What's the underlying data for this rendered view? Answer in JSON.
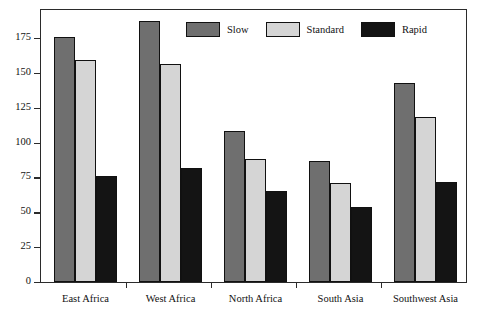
{
  "chart_data": {
    "type": "bar",
    "title": "",
    "xlabel": "",
    "ylabel": "Percent",
    "ylim": [
      0,
      195
    ],
    "yticks": [
      0,
      25,
      50,
      75,
      100,
      125,
      150,
      175
    ],
    "ytick_labels": [
      "0",
      "25",
      "50",
      "75",
      "100",
      "125",
      "150",
      "175"
    ],
    "grid": false,
    "legend_position": "top-center-inside",
    "categories": [
      "East Africa",
      "West Africa",
      "North Africa",
      "South Asia",
      "Southwest Asia"
    ],
    "series": [
      {
        "name": "Slow",
        "color": "#6f6f6f",
        "values": [
          176,
          187,
          108,
          87,
          143
        ]
      },
      {
        "name": "Standard",
        "color": "#d5d5d5",
        "values": [
          159,
          156,
          88,
          71,
          118
        ]
      },
      {
        "name": "Rapid",
        "color": "#141414",
        "values": [
          76,
          82,
          65,
          54,
          72
        ]
      }
    ]
  },
  "axis": {
    "y_title": "Percent"
  },
  "legend": {
    "entries": [
      {
        "label": "Slow",
        "swatch": "slow"
      },
      {
        "label": "Standard",
        "swatch": "standard"
      },
      {
        "label": "Rapid",
        "swatch": "rapid"
      }
    ]
  }
}
